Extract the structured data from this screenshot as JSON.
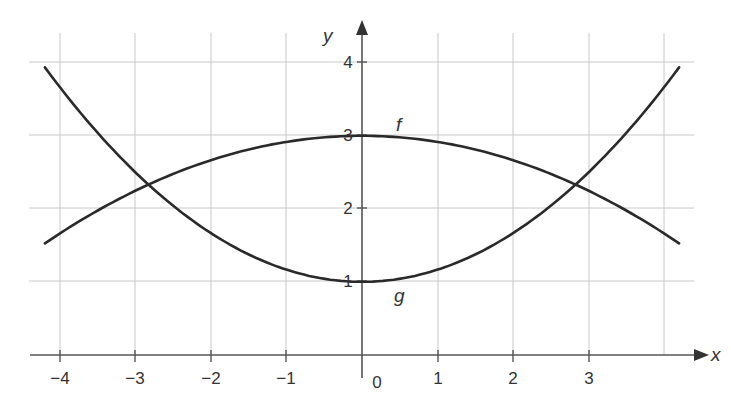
{
  "chart_data": {
    "type": "line",
    "title": "",
    "xlabel": "x",
    "ylabel": "y",
    "xlim": [
      -4.2,
      4.4
    ],
    "ylim": [
      0,
      4.4
    ],
    "grid": true,
    "legend": "none (curves labeled inline)",
    "x_ticks": [
      -4,
      -3,
      -2,
      -1,
      0,
      1,
      2,
      3
    ],
    "x_tick_labels": [
      "−4",
      "−3",
      "−2",
      "−1",
      "0",
      "1",
      "2",
      "3"
    ],
    "y_ticks": [
      1,
      2,
      3,
      4
    ],
    "y_tick_labels": [
      "1",
      "2",
      "3",
      "4"
    ],
    "series": [
      {
        "name": "f",
        "shape": "downward parabola, max 3 at x=0",
        "approx_formula": "f(x) = 3 - x^2/12",
        "x": [
          -4.2,
          -3,
          -2,
          -1,
          0,
          1,
          2,
          3,
          4.2
        ],
        "values": [
          1.53,
          2.25,
          2.67,
          2.92,
          3.0,
          2.92,
          2.67,
          2.25,
          1.53
        ]
      },
      {
        "name": "g",
        "shape": "upward parabola, min 1 at x=0",
        "approx_formula": "g(x) = 1 + x^2/6",
        "x": [
          -4.2,
          -3,
          -2,
          -1,
          0,
          1,
          2,
          3,
          4.2
        ],
        "values": [
          3.94,
          2.5,
          1.67,
          1.17,
          1.0,
          1.17,
          1.67,
          2.5,
          3.94
        ]
      }
    ],
    "annotations": [
      {
        "text": "f",
        "near": [
          0.5,
          3.2
        ]
      },
      {
        "text": "g",
        "near": [
          0.5,
          0.8
        ]
      },
      {
        "text": "intersection",
        "at": [
          -2.83,
          2.33
        ]
      },
      {
        "text": "intersection",
        "at": [
          2.83,
          2.33
        ]
      }
    ]
  },
  "labels": {
    "x_axis": "x",
    "y_axis": "y",
    "f": "f",
    "g": "g",
    "x_ticks": {
      "m4": "−4",
      "m3": "−3",
      "m2": "−2",
      "m1": "−1",
      "zero": "0",
      "p1": "1",
      "p2": "2",
      "p3": "3"
    },
    "y_ticks": {
      "p1": "1",
      "p2": "2",
      "p3": "3",
      "p4": "4"
    }
  },
  "colors": {
    "curve": "#2a2a2a",
    "grid": "#c8c8c8",
    "axis": "#555555",
    "text": "#333333"
  }
}
